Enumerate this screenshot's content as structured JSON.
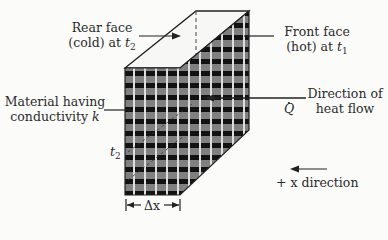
{
  "diagram": {
    "labels": {
      "rear_face_line1": "Rear face",
      "rear_face_line2_pre": "(cold) at ",
      "rear_face_var": "t",
      "rear_face_sub": "2",
      "front_face_line1": "Front face",
      "front_face_line2_pre": "(hot) at ",
      "front_face_var": "t",
      "front_face_sub": "1",
      "material_line1": "Material having",
      "material_line2_pre": "conductivity ",
      "material_var": "k",
      "direction_line1": "Direction of",
      "direction_line2": "heat flow",
      "heat_rate_symbol": "Q",
      "t2_var": "t",
      "t2_sub": "2",
      "thickness_label": "Δx",
      "x_direction_label": "+ x direction"
    },
    "colors": {
      "background": "#fbfbfa",
      "hatch_dark": "#111111",
      "hatch_mid": "#7a7a7a",
      "grid_line": "#d8d8d8",
      "outline": "#222222"
    }
  }
}
